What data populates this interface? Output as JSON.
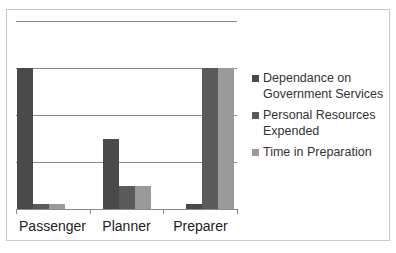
{
  "chart_data": {
    "type": "bar",
    "title": "",
    "xlabel": "",
    "ylabel": "",
    "categories": [
      "Passenger",
      "Planner",
      "Preparer"
    ],
    "series": [
      {
        "name": "Dependance on Government Services",
        "color": "#4a4a4a",
        "values": [
          3,
          1.5,
          0.1
        ]
      },
      {
        "name": "Personal Resources Expended",
        "color": "#5a5a5a",
        "values": [
          0.1,
          0.5,
          3
        ]
      },
      {
        "name": "Time in Preparation",
        "color": "#9a9a9a",
        "values": [
          0.1,
          0.5,
          3
        ]
      }
    ],
    "ylim": [
      0,
      4
    ],
    "grid": true,
    "gridlines": [
      1,
      2,
      3,
      4
    ],
    "legend_position": "right"
  },
  "legend": {
    "items": [
      {
        "label": "Dependance on Government Services"
      },
      {
        "label": "Personal Resources Expended"
      },
      {
        "label": "Time in Preparation"
      }
    ]
  },
  "axis": {
    "x_labels": [
      "Passenger",
      "Planner",
      "Preparer"
    ]
  }
}
